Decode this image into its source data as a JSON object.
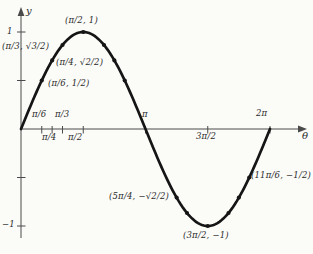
{
  "figure": {
    "background": "#fbfbf8",
    "curve_color": "#151515",
    "axis_color": "#4a4a4a",
    "text_color": "#2a2a2a"
  },
  "chart_data": {
    "type": "line",
    "title": "",
    "function": "y = sin(θ)",
    "xlabel": "θ",
    "ylabel": "y",
    "x_domain": [
      0,
      6.28319
    ],
    "ylim": [
      -1,
      1
    ],
    "grid": "off",
    "x_ticks": [
      {
        "label": "π/6",
        "value": 0.5236
      },
      {
        "label": "π/4",
        "value": 0.7854
      },
      {
        "label": "π/3",
        "value": 1.0472
      },
      {
        "label": "π/2",
        "value": 1.5708
      },
      {
        "label": "π",
        "value": 3.1416
      },
      {
        "label": "3π/2",
        "value": 4.7124
      },
      {
        "label": "2π",
        "value": 6.2832
      }
    ],
    "y_ticks": [
      {
        "label": "1",
        "value": 1
      },
      {
        "label": "",
        "value": 0.5
      },
      {
        "label": "",
        "value": -0.5
      },
      {
        "label": "−1",
        "value": -1
      }
    ],
    "marked_points": [
      {
        "theta": 0.5236,
        "y": 0.5
      },
      {
        "theta": 0.7854,
        "y": 0.7071
      },
      {
        "theta": 1.0472,
        "y": 0.866
      },
      {
        "theta": 1.5708,
        "y": 1
      },
      {
        "theta": 2.0944,
        "y": 0.866
      },
      {
        "theta": 2.3562,
        "y": 0.7071
      },
      {
        "theta": 2.618,
        "y": 0.5
      },
      {
        "theta": 3.927,
        "y": -0.7071
      },
      {
        "theta": 4.1888,
        "y": -0.866
      },
      {
        "theta": 4.7124,
        "y": -1
      },
      {
        "theta": 5.236,
        "y": -0.866
      },
      {
        "theta": 5.4978,
        "y": -0.7071
      },
      {
        "theta": 5.7596,
        "y": -0.5
      }
    ],
    "annotations": [
      {
        "text": "(π/2, 1)"
      },
      {
        "text": "(π/3, √3/2)"
      },
      {
        "text": "(π/4, √2/2)"
      },
      {
        "text": "(π/6, 1/2)"
      },
      {
        "text": "(5π/4, −√2/2)"
      },
      {
        "text": "(3π/2, −1)"
      },
      {
        "text": "(11π/6, −1/2)"
      }
    ]
  }
}
